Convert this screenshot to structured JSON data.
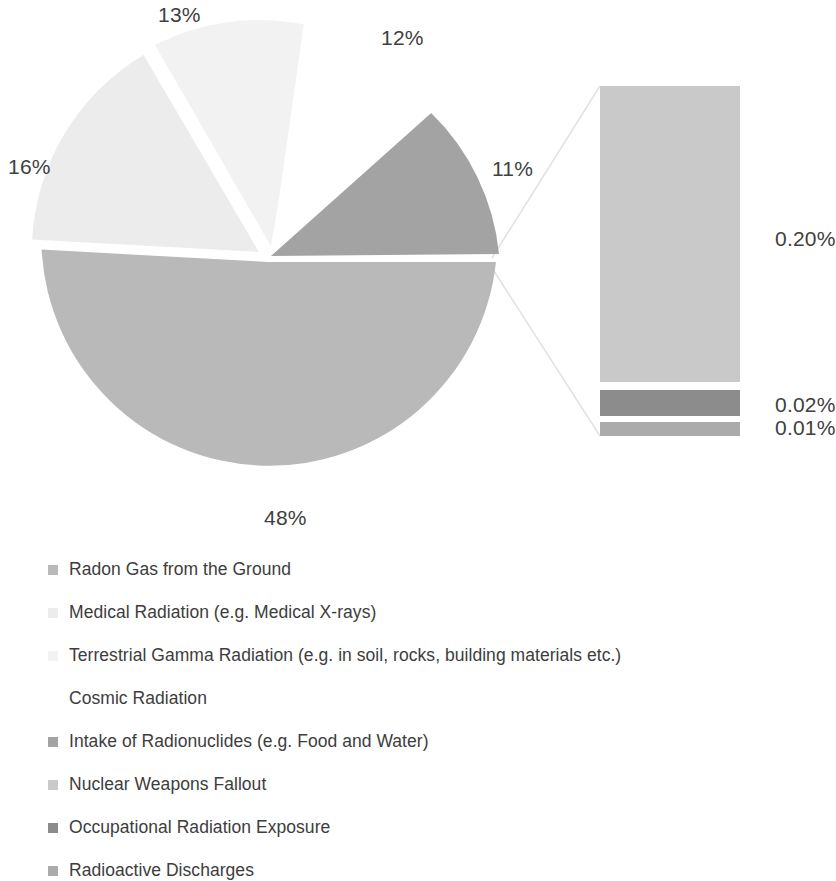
{
  "chart_data": {
    "type": "pie",
    "title": "",
    "subtitle": "",
    "xlabel": "",
    "ylabel": "",
    "legend_position": "bottom",
    "grid": false,
    "note": "Pie of pie / bar-of-pie chart: sources of radiation exposure. Main pie shows five slices; the smallest group is exploded into a stacked bar showing three sub-values.",
    "categories": [
      "Radon Gas from the Ground",
      "Medical Radiation (e.g. Medical X-rays)",
      "Terrestrial Gamma Radiation (e.g. in soil, rocks, building materials etc.)",
      "Cosmic Radiation",
      "Intake of Radionuclides (e.g. Food and Water)",
      "Nuclear Weapons Fallout",
      "Occupational Radiation Exposure",
      "Radioactive Discharges"
    ],
    "values": [
      48,
      16,
      13,
      12,
      11,
      0.2,
      0.02,
      0.01
    ],
    "labels": [
      "48%",
      "16%",
      "13%",
      "12%",
      "11%",
      "0.20%",
      "0.02%",
      "0.01%"
    ],
    "colors": [
      "#b9b9b9",
      "#ececec",
      "#f2f2f2",
      "#ffffff",
      "#a3a3a3",
      "#c9c9c9",
      "#8c8c8c",
      "#ababab"
    ],
    "pie_slices": [
      {
        "label": "48%",
        "value": 48,
        "color": "#b9b9b9",
        "category": "Radon Gas from the Ground"
      },
      {
        "label": "16%",
        "value": 16,
        "color": "#ececec",
        "category": "Medical Radiation (e.g. Medical X-rays)"
      },
      {
        "label": "13%",
        "value": 13,
        "color": "#f2f2f2",
        "category": "Terrestrial Gamma Radiation (e.g. in soil, rocks, building materials etc.)"
      },
      {
        "label": "12%",
        "value": 12,
        "color": "#ffffff",
        "category": "Cosmic Radiation"
      },
      {
        "label": "11%",
        "value": 11,
        "color": "#a3a3a3",
        "category": "Intake of Radionuclides (e.g. Food and Water)"
      }
    ],
    "bar_segments": [
      {
        "label": "0.20%",
        "value": 0.2,
        "color": "#c9c9c9",
        "category": "Nuclear Weapons Fallout"
      },
      {
        "label": "0.02%",
        "value": 0.02,
        "color": "#8c8c8c",
        "category": "Occupational Radiation Exposure"
      },
      {
        "label": "0.01%",
        "value": 0.01,
        "color": "#ababab",
        "category": "Radioactive Discharges"
      }
    ]
  },
  "pie_labels": {
    "p13": "13%",
    "p12": "12%",
    "p16": "16%",
    "p11": "11%",
    "p48": "48%"
  },
  "bar_labels": {
    "b020": "0.20%",
    "b002": "0.02%",
    "b001": "0.01%"
  },
  "legend": {
    "items": [
      {
        "label": "Radon Gas from the Ground",
        "color": "#b9b9b9"
      },
      {
        "label": "Medical Radiation (e.g. Medical X-rays)",
        "color": "#ececec"
      },
      {
        "label": "Terrestrial Gamma Radiation (e.g. in soil, rocks, building materials etc.)",
        "color": "#f2f2f2"
      },
      {
        "label": "Cosmic Radiation",
        "color": "#ffffff"
      },
      {
        "label": "Intake of Radionuclides (e.g. Food and Water)",
        "color": "#a3a3a3"
      },
      {
        "label": "Nuclear Weapons Fallout",
        "color": "#c9c9c9"
      },
      {
        "label": "Occupational Radiation Exposure",
        "color": "#8c8c8c"
      },
      {
        "label": "Radioactive Discharges",
        "color": "#ababab"
      }
    ]
  }
}
